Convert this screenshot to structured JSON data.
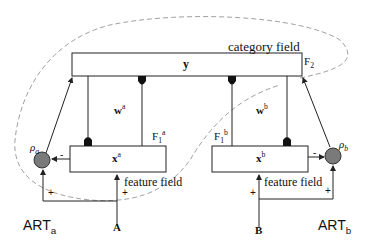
{
  "diagram": {
    "category_field": {
      "label": "category field",
      "node": "y",
      "layer": "F",
      "layer_sub": "2"
    },
    "module_a": {
      "name": "ART",
      "name_sub": "a",
      "weights": "w",
      "weights_sup": "a",
      "layer": "F",
      "layer_sub": "1",
      "layer_sup": "a",
      "node": "x",
      "node_sup": "a",
      "vigilance": "ρ",
      "vigilance_sub": "a",
      "feature_label": "feature field",
      "input": "A",
      "sign_minus": "-",
      "sign_plus_1": "+",
      "sign_plus_2": "+"
    },
    "module_b": {
      "name": "ART",
      "name_sub": "b",
      "weights": "w",
      "weights_sup": "b",
      "layer": "F",
      "layer_sub": "1",
      "layer_sup": "b",
      "node": "x",
      "node_sup": "b",
      "vigilance": "ρ",
      "vigilance_sub": "b",
      "feature_label": "feature field",
      "input": "B",
      "sign_minus": "-",
      "sign_plus_1": "+",
      "sign_plus_2": "+"
    },
    "colors": {
      "line": "#222222",
      "node_fill": "#7a7a7a",
      "dash": "#888888"
    }
  }
}
